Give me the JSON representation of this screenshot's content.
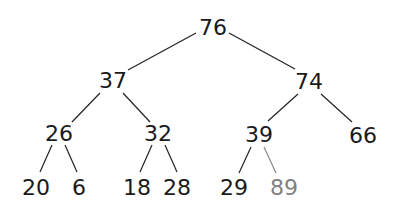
{
  "diagram": {
    "type": "binary-tree",
    "colors": {
      "default": "#1a1a1a",
      "highlight": "#7f7f7f",
      "edge": "#222222",
      "edge_highlight": "#888888"
    },
    "nodes": [
      {
        "id": "n76",
        "label": "76",
        "x": 213,
        "y": 27,
        "highlight": false
      },
      {
        "id": "n37",
        "label": "37",
        "x": 113,
        "y": 80,
        "highlight": false
      },
      {
        "id": "n74",
        "label": "74",
        "x": 309,
        "y": 81,
        "highlight": false
      },
      {
        "id": "n26",
        "label": "26",
        "x": 59,
        "y": 133,
        "highlight": false
      },
      {
        "id": "n32",
        "label": "32",
        "x": 158,
        "y": 133,
        "highlight": false
      },
      {
        "id": "n39",
        "label": "39",
        "x": 259,
        "y": 134,
        "highlight": false
      },
      {
        "id": "n66",
        "label": "66",
        "x": 363,
        "y": 135,
        "highlight": false
      },
      {
        "id": "n20",
        "label": "20",
        "x": 36,
        "y": 187,
        "highlight": false
      },
      {
        "id": "n6",
        "label": "6",
        "x": 79,
        "y": 187,
        "highlight": false
      },
      {
        "id": "n18",
        "label": "18",
        "x": 137,
        "y": 187,
        "highlight": false
      },
      {
        "id": "n28",
        "label": "28",
        "x": 177,
        "y": 187,
        "highlight": false
      },
      {
        "id": "n29",
        "label": "29",
        "x": 234,
        "y": 187,
        "highlight": false
      },
      {
        "id": "n89",
        "label": "89",
        "x": 284,
        "y": 187,
        "highlight": true
      }
    ],
    "edges": [
      {
        "from": "n76",
        "to": "n37",
        "x1": 196,
        "y1": 33,
        "x2": 128,
        "y2": 70,
        "highlight": false
      },
      {
        "from": "n76",
        "to": "n74",
        "x1": 229,
        "y1": 33,
        "x2": 295,
        "y2": 69,
        "highlight": false
      },
      {
        "from": "n37",
        "to": "n26",
        "x1": 100,
        "y1": 93,
        "x2": 72,
        "y2": 122,
        "highlight": false
      },
      {
        "from": "n37",
        "to": "n32",
        "x1": 123,
        "y1": 93,
        "x2": 150,
        "y2": 122,
        "highlight": false
      },
      {
        "from": "n74",
        "to": "n39",
        "x1": 298,
        "y1": 94,
        "x2": 268,
        "y2": 121,
        "highlight": false
      },
      {
        "from": "n74",
        "to": "n66",
        "x1": 321,
        "y1": 94,
        "x2": 352,
        "y2": 122,
        "highlight": false
      },
      {
        "from": "n26",
        "to": "n20",
        "x1": 52,
        "y1": 145,
        "x2": 40,
        "y2": 172,
        "highlight": false
      },
      {
        "from": "n26",
        "to": "n6",
        "x1": 65,
        "y1": 145,
        "x2": 77,
        "y2": 172,
        "highlight": false
      },
      {
        "from": "n32",
        "to": "n18",
        "x1": 152,
        "y1": 145,
        "x2": 140,
        "y2": 172,
        "highlight": false
      },
      {
        "from": "n32",
        "to": "n28",
        "x1": 165,
        "y1": 145,
        "x2": 177,
        "y2": 172,
        "highlight": false
      },
      {
        "from": "n39",
        "to": "n29",
        "x1": 251,
        "y1": 147,
        "x2": 239,
        "y2": 173,
        "highlight": false
      },
      {
        "from": "n39",
        "to": "n89",
        "x1": 264,
        "y1": 147,
        "x2": 276,
        "y2": 173,
        "highlight": true
      }
    ]
  }
}
